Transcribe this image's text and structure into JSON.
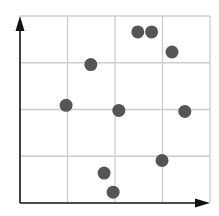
{
  "chart_data": {
    "type": "scatter",
    "title": "",
    "xlabel": "",
    "ylabel": "",
    "xlim": [
      0,
      4
    ],
    "ylim": [
      0,
      4
    ],
    "grid": true,
    "grid_divisions": 4,
    "legend": null,
    "tick_labels": false,
    "points": [
      {
        "x": 2.48,
        "y": 3.66
      },
      {
        "x": 2.77,
        "y": 3.66
      },
      {
        "x": 3.2,
        "y": 3.23
      },
      {
        "x": 1.49,
        "y": 2.96
      },
      {
        "x": 0.97,
        "y": 2.09
      },
      {
        "x": 2.08,
        "y": 1.98
      },
      {
        "x": 3.47,
        "y": 1.96
      },
      {
        "x": 2.99,
        "y": 0.91
      },
      {
        "x": 1.77,
        "y": 0.64
      },
      {
        "x": 1.96,
        "y": 0.23
      }
    ],
    "marker_color": "#555555",
    "axis_color": "#111111",
    "grid_color": "#cccccc"
  }
}
